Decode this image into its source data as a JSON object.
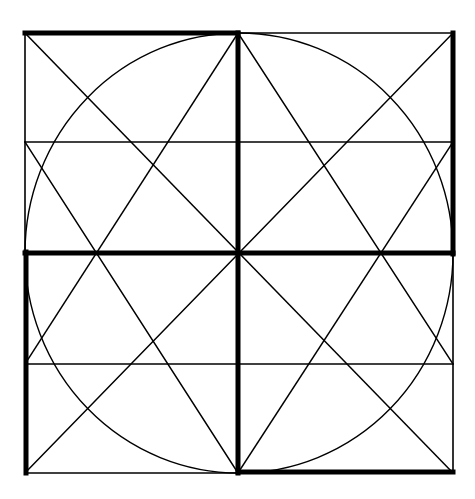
{
  "diagram": {
    "type": "geometric-construction",
    "colors": {
      "background": "#ffffff",
      "stroke": "#000000"
    },
    "outer_square": {
      "x1": 25,
      "y1": 33,
      "x2": 453,
      "y2": 473
    },
    "center": {
      "x": 238,
      "y": 252
    },
    "circle": {
      "cx": 239,
      "cy": 253,
      "rx": 214,
      "ry": 220
    },
    "thin_horizontals": [
      142,
      364
    ],
    "thick_segments": [
      {
        "name": "top-left-edge",
        "x1": 25,
        "y1": 33,
        "x2": 238,
        "y2": 33
      },
      {
        "name": "center-vertical",
        "x1": 238,
        "y1": 33,
        "x2": 238,
        "y2": 473
      },
      {
        "name": "right-upper-edge",
        "x1": 453,
        "y1": 33,
        "x2": 453,
        "y2": 254
      },
      {
        "name": "center-horizontal",
        "x1": 25,
        "y1": 253,
        "x2": 453,
        "y2": 253
      },
      {
        "name": "left-lower-edge",
        "x1": 26,
        "y1": 252,
        "x2": 26,
        "y2": 473
      },
      {
        "name": "bottom-right-edge",
        "x1": 238,
        "y1": 472,
        "x2": 453,
        "y2": 472
      }
    ],
    "thin_edges": [
      {
        "name": "top-right-edge",
        "x1": 238,
        "y1": 33,
        "x2": 453,
        "y2": 33
      },
      {
        "name": "right-lower-edge",
        "x1": 453,
        "y1": 252,
        "x2": 453,
        "y2": 473
      },
      {
        "name": "bottom-left-edge",
        "x1": 25,
        "y1": 473,
        "x2": 238,
        "y2": 473
      },
      {
        "name": "left-upper-edge",
        "x1": 25,
        "y1": 33,
        "x2": 25,
        "y2": 253
      }
    ],
    "diagonals": [
      {
        "name": "diagonal-tl-br",
        "x1": 25,
        "y1": 33,
        "x2": 453,
        "y2": 473
      },
      {
        "name": "diagonal-tr-bl",
        "x1": 453,
        "y1": 33,
        "x2": 25,
        "y2": 473
      },
      {
        "name": "line-topcenter-left",
        "x1": 238,
        "y1": 33,
        "x2": 25,
        "y2": 364
      },
      {
        "name": "line-topcenter-right",
        "x1": 238,
        "y1": 33,
        "x2": 453,
        "y2": 364
      },
      {
        "name": "line-bottomcenter-left",
        "x1": 238,
        "y1": 473,
        "x2": 25,
        "y2": 142
      },
      {
        "name": "line-bottomcenter-right",
        "x1": 238,
        "y1": 473,
        "x2": 453,
        "y2": 142
      }
    ]
  }
}
